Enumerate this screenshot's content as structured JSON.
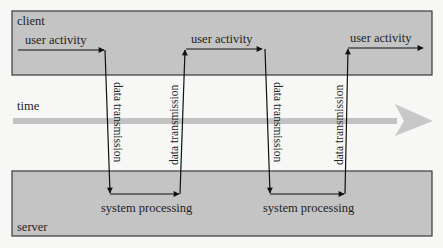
{
  "diagram": {
    "lanes": {
      "client": {
        "label": "client",
        "fill": "#c4c4c4",
        "stroke": "#3a3a3a"
      },
      "server": {
        "label": "server",
        "fill": "#c4c4c4",
        "stroke": "#3a3a3a"
      }
    },
    "timeline": {
      "label": "time",
      "color": "#c2c2c2"
    },
    "flow": {
      "client_steps": [
        "user activity",
        "user activity",
        "user activity"
      ],
      "server_steps": [
        "system processing",
        "system processing"
      ],
      "transmissions": [
        {
          "label": "data transmission",
          "direction": "client-to-server"
        },
        {
          "label": "data transmission",
          "direction": "server-to-client"
        },
        {
          "label": "data transmission",
          "direction": "client-to-server"
        },
        {
          "label": "data transmission",
          "direction": "server-to-client"
        }
      ]
    },
    "line_color": "#111111"
  }
}
